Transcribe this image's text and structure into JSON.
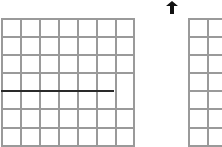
{
  "diagram": {
    "left_grid": {
      "columns": 7,
      "rows": 7,
      "highlighted_row_line": 4,
      "highlight_color": "#2a2a2a",
      "line_color": "#9a9a9a"
    },
    "right_grid": {
      "visible_columns": 2,
      "rows": 7,
      "line_color": "#9a9a9a"
    },
    "marker": {
      "icon": "up-arrow-icon",
      "color": "#111111"
    }
  }
}
